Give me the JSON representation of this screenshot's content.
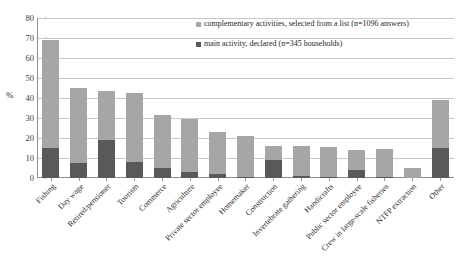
{
  "chart_data": {
    "type": "bar",
    "subtype": "stacked-vertical",
    "title": "",
    "xlabel": "",
    "ylabel": "%",
    "ylim": [
      0,
      80
    ],
    "ytick_step": 10,
    "yticks": [
      0,
      10,
      20,
      30,
      40,
      50,
      60,
      70,
      80
    ],
    "grid": true,
    "legend_position": "top-right",
    "categories": [
      "Fishing",
      "Day wage",
      "Retired/pensioner",
      "Tourism",
      "Commerce",
      "Agriculture",
      "Private sector employee",
      "Homemaker",
      "Construction",
      "Invertebrate gathering",
      "Handicrafts",
      "Public sector employee",
      "Crew in large-scale fisheries",
      "NTFP extraction",
      "Other"
    ],
    "series": [
      {
        "name": "main activity, declared (n=345 households)",
        "color": "#595959",
        "values": [
          15,
          7.5,
          19,
          8,
          5,
          3,
          2,
          0.5,
          9,
          1,
          0.5,
          4,
          0.5,
          0,
          15
        ]
      },
      {
        "name": "complementary activities, selected from a list (n=1096 answers)",
        "color": "#a6a6a6",
        "values": [
          54,
          37.5,
          24.5,
          34.5,
          26.5,
          26.5,
          21,
          20.5,
          7,
          15,
          15,
          10,
          14,
          5,
          24
        ]
      }
    ],
    "totals": [
      69,
      45,
      43.5,
      42.5,
      31.5,
      29.5,
      23,
      21,
      16,
      16,
      15.5,
      14,
      14.5,
      5,
      39
    ]
  },
  "legend": {
    "items": [
      {
        "label": "complementary activities, selected from a list (n=1096 answers)",
        "swatch": "complementary"
      },
      {
        "label": "main activity, declared (n=345 households)",
        "swatch": "main"
      }
    ]
  },
  "axis": {
    "y_title": "%"
  }
}
